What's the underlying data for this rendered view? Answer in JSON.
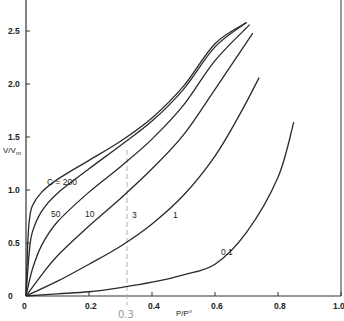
{
  "chart_data": {
    "type": "line",
    "title": "",
    "xlabel": "P/P°",
    "ylabel": "V/Vm",
    "xlim": [
      0,
      1.0
    ],
    "ylim": [
      0,
      2.8
    ],
    "grid": false,
    "legend": "inline curve labels",
    "x_ticks": [
      "0",
      "0.2",
      "0.4",
      "0.6",
      "0.8",
      "1.0"
    ],
    "y_ticks": [
      "0",
      "0.5",
      "1.0",
      "1.5",
      "2.0",
      "2.5"
    ],
    "annotations": [
      {
        "text": "0.3",
        "type": "handwritten",
        "x": 0.3
      },
      {
        "type": "dashed vertical line",
        "x": 0.32
      }
    ],
    "series": [
      {
        "name": "C=200",
        "label": "C=200",
        "points": [
          [
            0,
            0
          ],
          [
            0.005,
            0.45
          ],
          [
            0.01,
            0.7
          ],
          [
            0.02,
            0.85
          ],
          [
            0.05,
            0.98
          ],
          [
            0.1,
            1.1
          ],
          [
            0.2,
            1.28
          ],
          [
            0.3,
            1.46
          ],
          [
            0.4,
            1.68
          ],
          [
            0.5,
            1.98
          ],
          [
            0.6,
            2.38
          ],
          [
            0.7,
            2.58
          ]
        ]
      },
      {
        "name": "C=50",
        "label": "50",
        "points": [
          [
            0,
            0
          ],
          [
            0.01,
            0.4
          ],
          [
            0.02,
            0.6
          ],
          [
            0.05,
            0.8
          ],
          [
            0.1,
            0.97
          ],
          [
            0.2,
            1.2
          ],
          [
            0.3,
            1.42
          ],
          [
            0.4,
            1.65
          ],
          [
            0.5,
            1.95
          ],
          [
            0.6,
            2.35
          ],
          [
            0.7,
            2.58
          ]
        ]
      },
      {
        "name": "C=10",
        "label": "10",
        "points": [
          [
            0,
            0
          ],
          [
            0.02,
            0.25
          ],
          [
            0.05,
            0.48
          ],
          [
            0.1,
            0.7
          ],
          [
            0.2,
            0.98
          ],
          [
            0.3,
            1.22
          ],
          [
            0.4,
            1.48
          ],
          [
            0.5,
            1.8
          ],
          [
            0.6,
            2.22
          ],
          [
            0.71,
            2.56
          ]
        ]
      },
      {
        "name": "C=3",
        "label": "3",
        "points": [
          [
            0,
            0
          ],
          [
            0.05,
            0.2
          ],
          [
            0.1,
            0.38
          ],
          [
            0.2,
            0.66
          ],
          [
            0.3,
            0.92
          ],
          [
            0.4,
            1.2
          ],
          [
            0.5,
            1.52
          ],
          [
            0.6,
            1.95
          ],
          [
            0.72,
            2.48
          ]
        ]
      },
      {
        "name": "C=1",
        "label": "1",
        "points": [
          [
            0,
            0
          ],
          [
            0.1,
            0.14
          ],
          [
            0.2,
            0.3
          ],
          [
            0.3,
            0.47
          ],
          [
            0.4,
            0.68
          ],
          [
            0.5,
            0.95
          ],
          [
            0.6,
            1.32
          ],
          [
            0.68,
            1.72
          ],
          [
            0.74,
            2.06
          ]
        ]
      },
      {
        "name": "C=0.1",
        "label": "0.1",
        "points": [
          [
            0,
            0
          ],
          [
            0.1,
            0.02
          ],
          [
            0.2,
            0.04
          ],
          [
            0.3,
            0.08
          ],
          [
            0.4,
            0.13
          ],
          [
            0.5,
            0.2
          ],
          [
            0.6,
            0.3
          ],
          [
            0.7,
            0.6
          ],
          [
            0.8,
            1.12
          ],
          [
            0.85,
            1.64
          ]
        ]
      }
    ]
  },
  "labels": {
    "y_axis_title": "V/Vm",
    "x_axis_title": "P/P°",
    "handwritten_note": "0.3"
  }
}
